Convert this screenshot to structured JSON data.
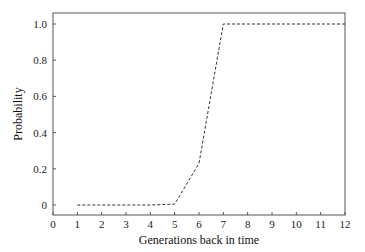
{
  "chart_data": {
    "type": "line",
    "title": "",
    "xlabel": "Generations back in time",
    "ylabel": "Probability",
    "xlim": [
      0,
      12
    ],
    "ylim": [
      -0.05,
      1.07
    ],
    "xticks": [
      0,
      1,
      2,
      3,
      4,
      5,
      6,
      7,
      8,
      9,
      10,
      11,
      12
    ],
    "xtick_labels": [
      "0",
      "1",
      "2",
      "3",
      "4",
      "5",
      "6",
      "7",
      "8",
      "9",
      "10",
      "11",
      "12"
    ],
    "yticks": [
      0,
      0.2,
      0.4,
      0.6,
      0.8,
      1.0
    ],
    "ytick_labels": [
      "0",
      "0.2",
      "0.4",
      "0.6",
      "0.8",
      "1.0"
    ],
    "grid": false,
    "legend": null,
    "series": [
      {
        "name": "probability",
        "style": "dashed",
        "color": "#333333",
        "x": [
          1,
          2,
          3,
          4,
          5,
          6,
          7,
          8,
          9,
          10,
          11,
          12
        ],
        "values": [
          0,
          0,
          0,
          0,
          0.005,
          0.23,
          1.0,
          1.0,
          1.0,
          1.0,
          1.0,
          1.0
        ]
      }
    ]
  },
  "colors": {
    "axis": "#555555",
    "line": "#333333",
    "background": "#ffffff"
  }
}
